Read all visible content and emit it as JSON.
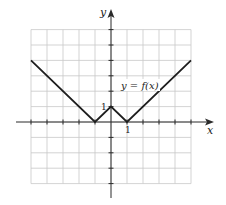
{
  "chart_data": {
    "type": "line",
    "title": "",
    "xlabel": "x",
    "ylabel": "y",
    "xlim": [
      -5,
      5
    ],
    "ylim": [
      -4,
      6
    ],
    "grid": true,
    "series": [
      {
        "name": "y = f(x)",
        "x": [
          -5,
          -1,
          0,
          1,
          5
        ],
        "y": [
          4,
          0,
          1,
          0,
          4
        ]
      }
    ],
    "annotations": [
      {
        "text": "y = f(x)",
        "x": 2.3,
        "y": 2.3
      },
      {
        "text": "1",
        "axis": "y",
        "value": 1
      },
      {
        "text": "1",
        "axis": "x",
        "value": 1
      }
    ],
    "tick_labels": {
      "x": [
        "1"
      ],
      "y": [
        "1"
      ]
    },
    "colors": {
      "curve": "#1e1e1e",
      "grid": "#c8c8c8",
      "axis": "#2a2a2a"
    }
  },
  "labels": {
    "x_axis": "x",
    "y_axis": "y",
    "curve": "y = f(x)",
    "x_tick": "1",
    "y_tick": "1"
  }
}
